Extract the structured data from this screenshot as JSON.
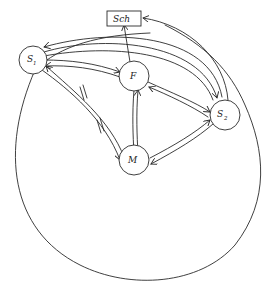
{
  "diagram": {
    "type": "directed-graph",
    "stroke_color": "#2a2a2a",
    "background": "#ffffff",
    "nodes": [
      {
        "id": "Sch",
        "label": "Sch",
        "shape": "rectangle"
      },
      {
        "id": "S1",
        "label": "S",
        "subscript": "1",
        "shape": "circle"
      },
      {
        "id": "F",
        "label": "F",
        "shape": "circle"
      },
      {
        "id": "S2",
        "label": "S",
        "subscript": "2",
        "shape": "circle"
      },
      {
        "id": "M",
        "label": "M",
        "shape": "circle"
      }
    ],
    "edges": [
      {
        "from": "F",
        "to": "Sch"
      },
      {
        "from": "S2",
        "to": "Sch"
      },
      {
        "from": "S1",
        "to": "F"
      },
      {
        "from": "F",
        "to": "S1"
      },
      {
        "from": "S1",
        "to": "S2"
      },
      {
        "from": "S2",
        "to": "S1"
      },
      {
        "from": "F",
        "to": "S2"
      },
      {
        "from": "S2",
        "to": "F"
      },
      {
        "from": "F",
        "to": "M"
      },
      {
        "from": "M",
        "to": "F"
      },
      {
        "from": "M",
        "to": "S2"
      },
      {
        "from": "S2",
        "to": "M"
      },
      {
        "from": "S1",
        "to": "M",
        "marked": "double-tick"
      },
      {
        "from": "M",
        "to": "S1",
        "marked": "double-tick"
      }
    ],
    "enclosing_boundary": "large circle enclosing S1, F, S2, M"
  }
}
